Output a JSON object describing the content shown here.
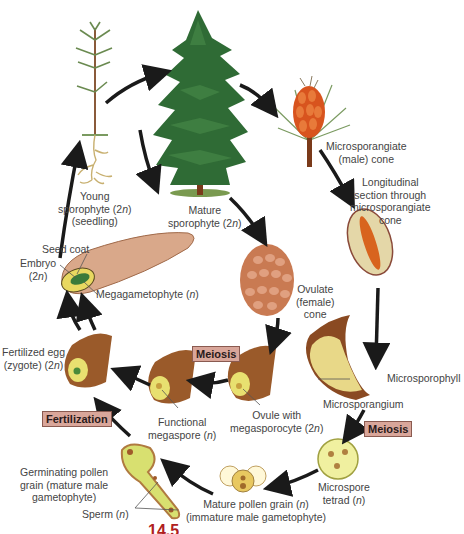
{
  "diagram": {
    "figure_number": "14.5",
    "colors": {
      "arrow": "#1a1a1a",
      "tag_bg": "#d9a69a",
      "tag_border": "#8a5a50",
      "tree_green": "#2f6b35",
      "trunk": "#7a3a1a",
      "male_cone": "#d8541e",
      "ovulate_cone": "#c97a52",
      "pollen_yellow": "#e8e08a",
      "figure_red": "#b02020"
    },
    "stages": {
      "young_sporophyte": {
        "line1": "Young",
        "line2": "sporophyte (2n)",
        "line3": "(seedling)"
      },
      "mature_sporophyte": {
        "line1": "Mature",
        "line2": "sporophyte (2n)"
      },
      "microsporangiate_cone": {
        "line1": "Microsporangiate",
        "line2": "(male) cone"
      },
      "longitudinal_section": {
        "line1": "Longitudinal",
        "line2": "section through",
        "line3": "microsporangiate",
        "line4": "cone"
      },
      "ovulate_cone": {
        "line1": "Ovulate",
        "line2": "(female)",
        "line3": "cone"
      },
      "microsporophyll": "Microsporophyll",
      "microsporangium": "Microsporangium",
      "microspore_tetrad": {
        "line1": "Microspore",
        "line2": "tetrad (n)"
      },
      "mature_pollen_grain": {
        "line1": "Mature pollen grain (n)",
        "line2": "(immature male gametophyte)"
      },
      "germinating_pollen_grain": {
        "line1": "Germinating pollen",
        "line2": "grain (mature male",
        "line3": "gametophyte)"
      },
      "sperm": "Sperm (n)",
      "ovule_megasporocyte": {
        "line1": "Ovule with",
        "line2": "megasporocyte (2n)"
      },
      "functional_megaspore": {
        "line1": "Functional",
        "line2": "megaspore (n)"
      },
      "fertilized_egg": {
        "line1": "Fertilized egg",
        "line2": "(zygote) (2n)"
      },
      "seed_coat": "Seed coat",
      "embryo": {
        "line1": "Embryo",
        "line2": "(2n)"
      },
      "megagametophyte": "Megagametophyte (n)"
    },
    "process_tags": {
      "meiosis_female": "Meiosis",
      "meiosis_male": "Meiosis",
      "fertilization": "Fertilization"
    }
  }
}
